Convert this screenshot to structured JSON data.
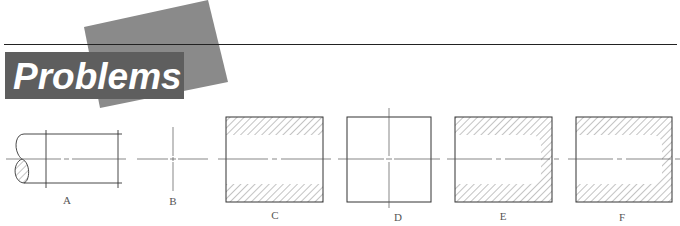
{
  "header": {
    "title": "Problems",
    "colors": {
      "title_box": "#5e5e5e",
      "accent_square": "#8a8a8a",
      "title_text": "#ffffff",
      "rule": "#222222"
    }
  },
  "figures": [
    {
      "id": "A",
      "label": "A",
      "description": "shaft side view with break symbol and centerline"
    },
    {
      "id": "B",
      "label": "B",
      "description": "center mark crosshair"
    },
    {
      "id": "C",
      "label": "C",
      "description": "section view with through hole, hatched walls"
    },
    {
      "id": "D",
      "label": "D",
      "description": "square end view with center crosshair"
    },
    {
      "id": "E",
      "label": "E",
      "description": "section view with blind hole, rounded bottom"
    },
    {
      "id": "F",
      "label": "F",
      "description": "section view with blind hole, rounded bottom"
    }
  ],
  "colors": {
    "line": "#333333",
    "hatch": "#777777",
    "centerline": "#555555",
    "label": "#555555"
  }
}
